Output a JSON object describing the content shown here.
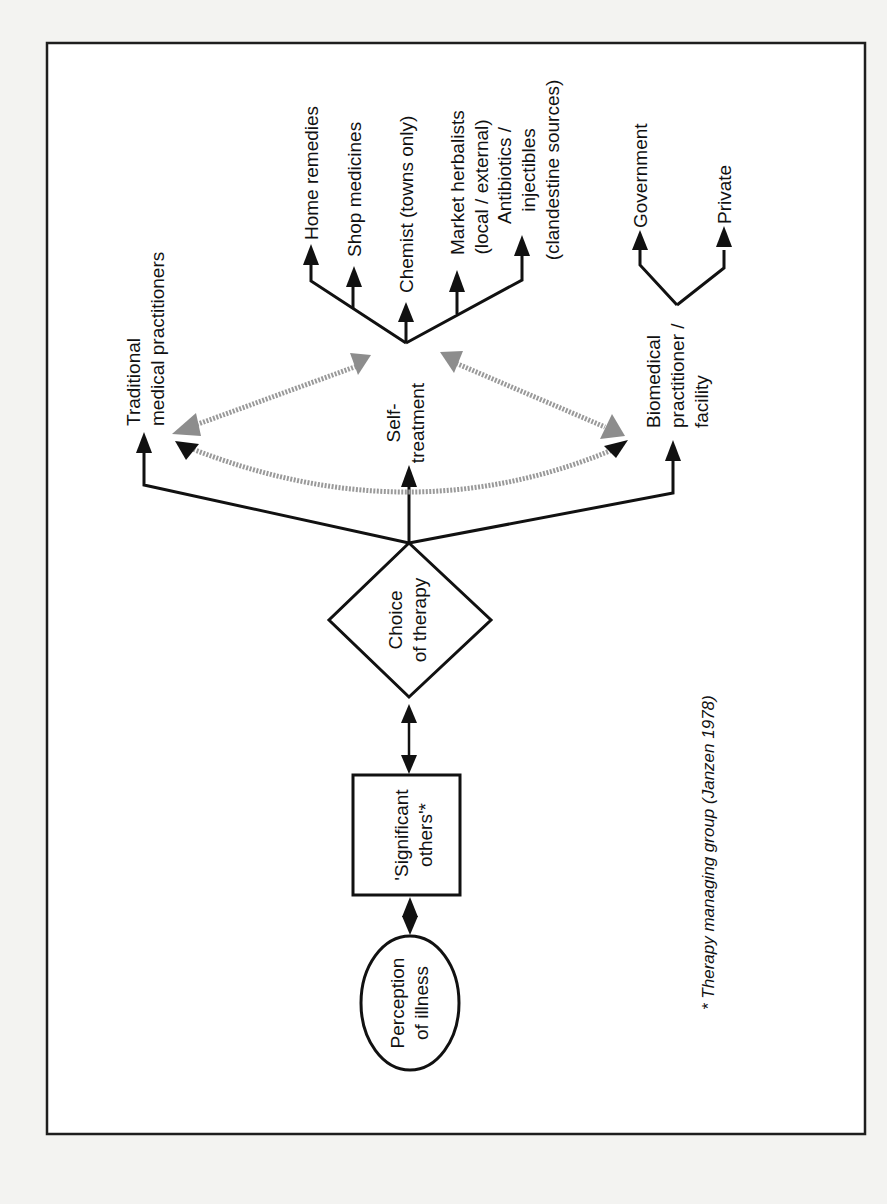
{
  "diagram": {
    "start_node": {
      "line1": "Perception",
      "line2": "of illness"
    },
    "group_node": {
      "line1": "'Significant",
      "line2": "others'*"
    },
    "decision_node": {
      "line1": "Choice",
      "line2": "of therapy"
    },
    "options": {
      "traditional": {
        "line1": "Traditional",
        "line2": "medical practitioners"
      },
      "self_treatment": {
        "line1": "Self-",
        "line2": "treatment"
      },
      "biomedical": {
        "line1": "Biomedical",
        "line2": "practitioner /",
        "line3": "facility"
      }
    },
    "self_treatment_sources": [
      {
        "line1": "Home remedies"
      },
      {
        "line1": "Shop medicines"
      },
      {
        "line1": "Chemist (towns only)"
      },
      {
        "line1": "Market herbalists",
        "line2": "(local / external)"
      },
      {
        "line1": "Antibiotics /",
        "line2": "injectibles",
        "line3": "(clandestine sources)"
      }
    ],
    "biomedical_types": [
      {
        "line1": "Government"
      },
      {
        "line1": "Private"
      }
    ],
    "footnote": "* Therapy managing group  (Janzen 1978)",
    "orientation": "rotated 90° counter-clockwise",
    "colors": {
      "ink": "#111111",
      "dotted_arrow": "#9a9a9a",
      "paper": "#ffffff"
    }
  }
}
